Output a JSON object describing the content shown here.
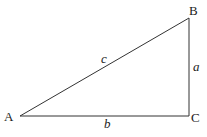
{
  "diagram": {
    "type": "right-triangle",
    "vertices": [
      {
        "id": "A",
        "label": "A",
        "x": 20,
        "y": 116
      },
      {
        "id": "B",
        "label": "B",
        "x": 189,
        "y": 18
      },
      {
        "id": "C",
        "label": "C",
        "x": 189,
        "y": 116
      }
    ],
    "sides": [
      {
        "id": "c",
        "label": "c",
        "from": "A",
        "to": "B"
      },
      {
        "id": "a",
        "label": "a",
        "from": "B",
        "to": "C"
      },
      {
        "id": "b",
        "label": "b",
        "from": "A",
        "to": "C"
      }
    ],
    "right_angle_at": "C",
    "stroke_color": "#333333",
    "text_color": "#222222"
  }
}
